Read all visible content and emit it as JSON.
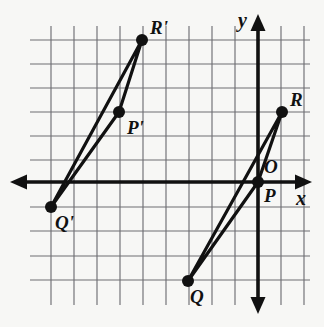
{
  "figure": {
    "background_color": "#f7f7f5",
    "grid_color": "#6e6e73",
    "axis_color": "#111111",
    "point_color": "#111111"
  },
  "grid": {
    "x_lines": [
      51,
      74,
      97,
      120,
      143,
      166,
      189,
      212,
      235,
      258,
      281,
      304
    ],
    "y_lines": [
      40,
      64,
      88,
      112,
      136,
      160,
      182,
      207,
      231,
      256,
      280
    ],
    "spacing_x": 23,
    "spacing_y": 24,
    "visible": true
  },
  "axes": {
    "x_axis": {
      "label": "x",
      "y_pixel": 182,
      "x_start": 10,
      "x_end": 312,
      "label_x": 296,
      "label_y": 188,
      "arrows": "both"
    },
    "y_axis": {
      "label": "y",
      "x_pixel": 258,
      "y_start": 14,
      "y_end": 314,
      "label_x": 238,
      "label_y": 10,
      "arrows": "both"
    },
    "origin": {
      "label": "O",
      "x": 258,
      "y": 182,
      "label_x": 264,
      "label_y": 157
    }
  },
  "chart_data": {
    "type": "scatter",
    "xlabel": "x",
    "ylabel": "y",
    "grid": true,
    "legend": "none",
    "points": [
      {
        "name": "P",
        "px": 258,
        "py": 182,
        "label": "P",
        "label_dx": 6,
        "label_dy": 4,
        "grid_x": 0,
        "grid_y": 0
      },
      {
        "name": "Q",
        "px": 188,
        "py": 281,
        "label": "Q",
        "label_dx": 2,
        "label_dy": 6,
        "grid_x": -3,
        "grid_y": -4
      },
      {
        "name": "R",
        "px": 282,
        "py": 112,
        "label": "R",
        "label_dx": 8,
        "label_dy": -22,
        "grid_x": 1,
        "grid_y": 3
      },
      {
        "name": "P'",
        "px": 119,
        "py": 112,
        "label": "P'",
        "label_dx": 8,
        "label_dy": 6,
        "grid_x": -6,
        "grid_y": 3
      },
      {
        "name": "Q'",
        "px": 51,
        "py": 207,
        "label": "Q'",
        "label_dx": 4,
        "label_dy": 6,
        "grid_x": -9,
        "grid_y": -1
      },
      {
        "name": "R'",
        "px": 142,
        "py": 40,
        "label": "R'",
        "label_dx": 8,
        "label_dy": -22,
        "grid_x": -5,
        "grid_y": 6
      }
    ],
    "triangles": [
      {
        "name": "PQR",
        "vertices": [
          "P",
          "Q",
          "R"
        ]
      },
      {
        "name": "PpQpRp",
        "vertices": [
          "P'",
          "Q'",
          "R'"
        ]
      }
    ]
  }
}
